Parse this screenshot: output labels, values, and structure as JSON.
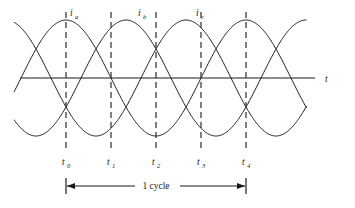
{
  "figure": {
    "title": "",
    "axis_label": "t",
    "span_label": "1 cycle",
    "curve_labels": [
      {
        "base": "i",
        "sub": "a",
        "x": 72,
        "y": 13
      },
      {
        "base": "i",
        "sub": "b",
        "x": 140,
        "y": 13
      },
      {
        "base": "i",
        "sub": "c",
        "x": 200,
        "y": 13
      }
    ],
    "time_markers": [
      {
        "base": "t",
        "sub": "0",
        "x": 66
      },
      {
        "base": "t",
        "sub": "1",
        "x": 111
      },
      {
        "base": "t",
        "sub": "2",
        "x": 156
      },
      {
        "base": "t",
        "sub": "3",
        "x": 201
      },
      {
        "base": "t",
        "sub": "4",
        "x": 246
      }
    ],
    "colors": {
      "stroke": "#1a1a1a",
      "dashed": "#2b2b2b",
      "background": "#ffffff"
    }
  },
  "chart_data": {
    "type": "line",
    "title": "",
    "xlabel": "t",
    "ylabel": "",
    "grid": false,
    "legend": "inline-curve-labels",
    "axis": {
      "x_start_px": 20,
      "x_end_px": 315,
      "baseline_px": 78
    },
    "amplitude_px": 58,
    "period_px": 180,
    "x": [
      0,
      45,
      90,
      135,
      180
    ],
    "series": [
      {
        "name": "i_a",
        "phase_deg": 90,
        "values": [
          1.0,
          0.0,
          -1.0,
          0.0,
          1.0
        ]
      },
      {
        "name": "i_b",
        "phase_deg": -30,
        "values": [
          -0.5,
          0.866,
          0.5,
          -0.866,
          -0.5
        ]
      },
      {
        "name": "i_c",
        "phase_deg": 210,
        "values": [
          -0.5,
          -0.866,
          0.5,
          0.866,
          -0.5
        ]
      }
    ],
    "tick_labels": [
      "t0",
      "t1",
      "t2",
      "t3",
      "t4"
    ],
    "annotations": [
      {
        "text": "1 cycle",
        "from": "t0",
        "to": "t4",
        "type": "dimension-arrow"
      }
    ],
    "ylim": [
      -1.15,
      1.15
    ]
  }
}
